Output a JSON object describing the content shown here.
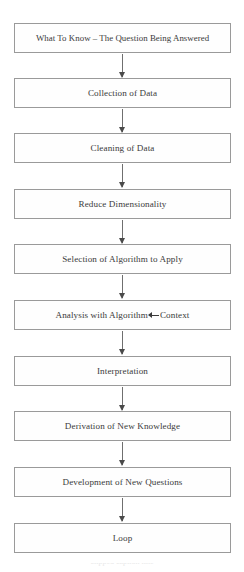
{
  "diagram": {
    "type": "flowchart",
    "orientation": "vertical",
    "colors": {
      "box_border": "#9a9a9a",
      "box_fill": "#fefefe",
      "text": "#3a3a3a",
      "connector": "#6f6f6f",
      "background": "#ffffff"
    },
    "nodes": [
      {
        "id": "what-to-know",
        "label": "What To Know – The Question Being Answered"
      },
      {
        "id": "collection-of-data",
        "label": "Collection of Data"
      },
      {
        "id": "cleaning-of-data",
        "label": "Cleaning of Data"
      },
      {
        "id": "reduce-dimensionality",
        "label": "Reduce Dimensionality"
      },
      {
        "id": "selection-of-algorithm",
        "label": "Selection of Algorithm to Apply"
      },
      {
        "id": "analysis-with-algorithm",
        "label_before_arrow": "Analysis with Algorithm",
        "arrow": "left-arrow",
        "label_after_arrow": "Context"
      },
      {
        "id": "interpretation",
        "label": "Interpretation"
      },
      {
        "id": "derivation-of-knowledge",
        "label": "Derivation of New Knowledge"
      },
      {
        "id": "development-of-questions",
        "label": "Development of New Questions"
      },
      {
        "id": "loop",
        "label": "Loop"
      }
    ],
    "connector_count": 9,
    "caption_remnant": "clipped caption line"
  }
}
